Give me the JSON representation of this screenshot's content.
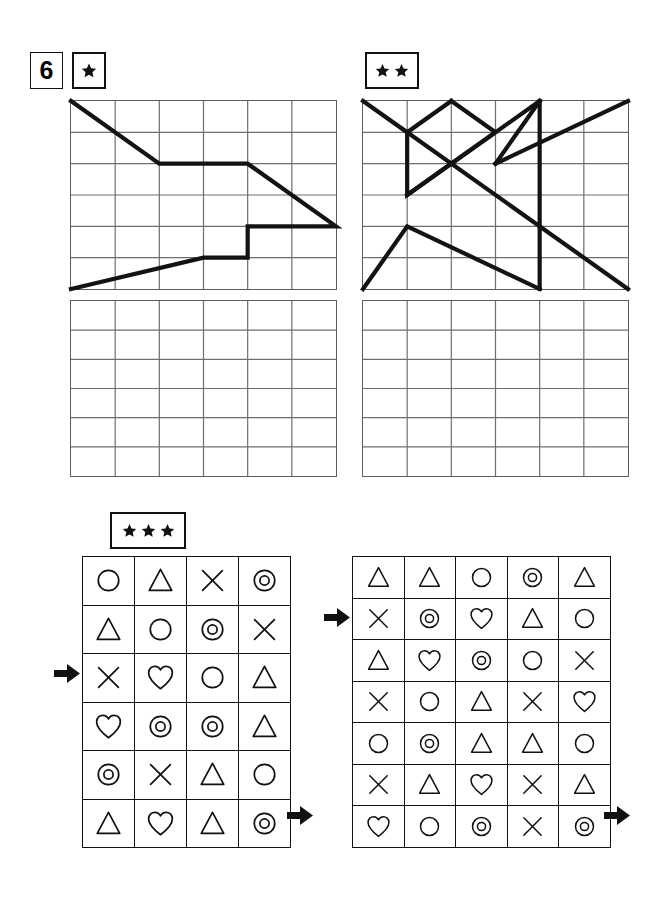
{
  "worksheet": {
    "exercise_number": "6",
    "difficulty_badges": [
      {
        "name": "one-star",
        "stars": 1
      },
      {
        "name": "two-star",
        "stars": 2
      },
      {
        "name": "three-star",
        "stars": 3
      }
    ]
  },
  "line_puzzles": [
    {
      "name": "puzzle-one-star",
      "difficulty": 1,
      "grid": {
        "cols": 6,
        "rows": 6
      },
      "paths": [
        [
          [
            0,
            0
          ],
          [
            2,
            2
          ],
          [
            4,
            2
          ],
          [
            6,
            4
          ],
          [
            4,
            4
          ],
          [
            4,
            5
          ],
          [
            3,
            5
          ],
          [
            0,
            6
          ]
        ]
      ],
      "answer_grid": {
        "cols": 6,
        "rows": 6,
        "empty": true
      }
    },
    {
      "name": "puzzle-two-star",
      "difficulty": 2,
      "grid": {
        "cols": 6,
        "rows": 6
      },
      "paths": [
        [
          [
            0,
            0
          ],
          [
            1,
            1
          ],
          [
            2,
            0
          ]
        ],
        [
          [
            1,
            1
          ],
          [
            1,
            3
          ],
          [
            3,
            1
          ],
          [
            2,
            0
          ]
        ],
        [
          [
            1,
            3
          ],
          [
            4,
            0
          ]
        ],
        [
          [
            4,
            0
          ],
          [
            4,
            6
          ]
        ],
        [
          [
            3,
            2
          ],
          [
            4,
            0
          ]
        ],
        [
          [
            3,
            2
          ],
          [
            6,
            0
          ]
        ],
        [
          [
            1,
            1
          ],
          [
            6,
            6
          ]
        ],
        [
          [
            0,
            6
          ],
          [
            1,
            4
          ],
          [
            4,
            6
          ]
        ]
      ],
      "answer_grid": {
        "cols": 6,
        "rows": 6,
        "empty": true
      }
    }
  ],
  "symbol_puzzle": {
    "name": "puzzle-three-star",
    "difficulty": 3,
    "left_table": {
      "name": "symbol-table-left",
      "cols": 4,
      "rows": 6,
      "cells": [
        [
          "circle",
          "triangle",
          "cross",
          "double-circle"
        ],
        [
          "triangle",
          "circle",
          "double-circle",
          "cross"
        ],
        [
          "cross",
          "heart",
          "circle",
          "triangle"
        ],
        [
          "heart",
          "double-circle",
          "double-circle",
          "triangle"
        ],
        [
          "double-circle",
          "cross",
          "triangle",
          "circle"
        ],
        [
          "triangle",
          "heart",
          "triangle",
          "double-circle"
        ]
      ],
      "markers": [
        {
          "name": "arrow-row-3-in",
          "direction": "right",
          "side": "left",
          "row": 3
        },
        {
          "name": "arrow-row-6-out",
          "direction": "right",
          "side": "right",
          "row": 6
        }
      ]
    },
    "right_table": {
      "name": "symbol-table-right",
      "cols": 5,
      "rows": 7,
      "cells": [
        [
          "triangle",
          "triangle",
          "circle",
          "double-circle",
          "triangle"
        ],
        [
          "cross",
          "double-circle",
          "heart",
          "triangle",
          "circle"
        ],
        [
          "triangle",
          "heart",
          "double-circle",
          "circle",
          "cross"
        ],
        [
          "cross",
          "circle",
          "triangle",
          "cross",
          "heart"
        ],
        [
          "circle",
          "double-circle",
          "triangle",
          "triangle",
          "circle"
        ],
        [
          "cross",
          "triangle",
          "heart",
          "cross",
          "triangle"
        ],
        [
          "heart",
          "circle",
          "double-circle",
          "cross",
          "double-circle"
        ]
      ],
      "markers": [
        {
          "name": "arrow-row-2-in",
          "direction": "right",
          "side": "left",
          "row": 2
        },
        {
          "name": "arrow-row-7-out",
          "direction": "right",
          "side": "right",
          "row": 7
        }
      ]
    }
  },
  "colors": {
    "ink": "#111111",
    "grid_line": "#6e6e6e",
    "paper": "#ffffff"
  }
}
